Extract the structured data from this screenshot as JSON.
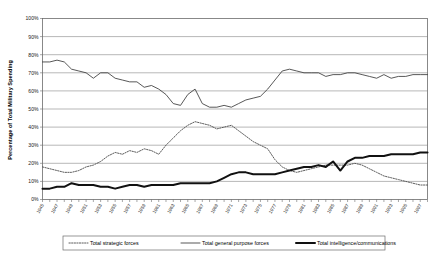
{
  "chart_data": {
    "type": "line",
    "title": "",
    "xlabel": "",
    "ylabel": "Percentage of Total Military Spending",
    "ylim": [
      0,
      100
    ],
    "ytick_labels": [
      "0%",
      "10%",
      "20%",
      "30%",
      "40%",
      "50%",
      "60%",
      "70%",
      "80%",
      "90%",
      "100%"
    ],
    "ytick_values": [
      0,
      10,
      20,
      30,
      40,
      50,
      60,
      70,
      80,
      90,
      100
    ],
    "grid": true,
    "legend_position": "bottom",
    "x": [
      1945,
      1946,
      1947,
      1948,
      1949,
      1950,
      1951,
      1952,
      1953,
      1954,
      1955,
      1956,
      1957,
      1958,
      1959,
      1960,
      1961,
      1962,
      1963,
      1964,
      1965,
      1966,
      1967,
      1968,
      1969,
      1970,
      1971,
      1972,
      1973,
      1974,
      1975,
      1976,
      1977,
      1978,
      1979,
      1980,
      1981,
      1982,
      1983,
      1984,
      1985,
      1986,
      1987,
      1988,
      1989,
      1990,
      1991,
      1992,
      1993,
      1994,
      1995,
      1996,
      1997,
      1998
    ],
    "xtick_labels": [
      "1945",
      "1947",
      "1949",
      "1951",
      "1953",
      "1955",
      "1957",
      "1959",
      "1961",
      "1963",
      "1965",
      "1967",
      "1969",
      "1971",
      "1973",
      "1975",
      "1977",
      "1979",
      "1981",
      "1983",
      "1985",
      "1987",
      "1989",
      "1991",
      "1993",
      "1995",
      "1997"
    ],
    "series": [
      {
        "name": "Total strategic forces",
        "style": "dotted",
        "color": "#4a4a4a",
        "values": [
          18,
          17,
          16,
          15,
          15,
          16,
          18,
          19,
          21,
          24,
          26,
          25,
          27,
          26,
          28,
          27,
          25,
          30,
          34,
          38,
          41,
          43,
          42,
          41,
          39,
          40,
          41,
          38,
          35,
          32,
          30,
          28,
          22,
          18,
          16,
          15,
          16,
          17,
          18,
          19,
          19,
          19,
          19,
          20,
          19,
          17,
          15,
          13,
          12,
          11,
          10,
          9,
          8,
          8
        ]
      },
      {
        "name": "Total general purpose forces",
        "style": "solid-thin",
        "color": "#3a3a3a",
        "values": [
          76,
          76,
          77,
          76,
          72,
          71,
          70,
          67,
          70,
          70,
          67,
          66,
          65,
          65,
          62,
          63,
          61,
          58,
          53,
          52,
          58,
          61,
          53,
          51,
          51,
          52,
          51,
          53,
          55,
          56,
          57,
          61,
          66,
          71,
          72,
          71,
          70,
          70,
          70,
          68,
          69,
          69,
          70,
          70,
          69,
          68,
          67,
          69,
          67,
          68,
          68,
          69,
          69,
          69
        ]
      },
      {
        "name": "Total intelligence/communications",
        "style": "solid-thick",
        "color": "#111111",
        "values": [
          6,
          6,
          7,
          7,
          9,
          8,
          8,
          8,
          7,
          7,
          6,
          7,
          8,
          8,
          7,
          8,
          8,
          8,
          8,
          9,
          9,
          9,
          9,
          9,
          10,
          12,
          14,
          15,
          15,
          14,
          14,
          14,
          14,
          15,
          16,
          17,
          18,
          18,
          19,
          18,
          21,
          16,
          21,
          23,
          23,
          24,
          24,
          24,
          25,
          25,
          25,
          25,
          26,
          26
        ]
      }
    ]
  }
}
